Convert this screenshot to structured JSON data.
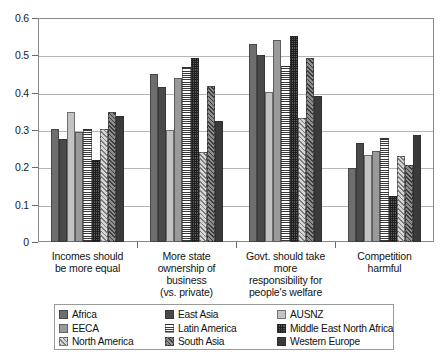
{
  "chart_data": {
    "type": "bar",
    "title": "",
    "subtitle": "",
    "xlabel": "",
    "ylabel": "",
    "ylim": [
      0,
      0.6
    ],
    "ytick_values": [
      0,
      0.1,
      0.2,
      0.3,
      0.4,
      0.5,
      0.6
    ],
    "ytick_labels": [
      "0",
      "0.1",
      "0.2",
      "0.3",
      "0.4",
      "0.5",
      "0.6"
    ],
    "grid": "horizontal",
    "legend_position": "bottom",
    "categories": [
      "Incomes should\nbe more equal",
      "More state\nownership of\nbusiness\n(vs. private)",
      "Govt. should take\nmore\nresponsibility for\npeople's welfare",
      "Competition\nharmful"
    ],
    "category_lines": [
      [
        "Incomes should",
        "be more equal"
      ],
      [
        "More state",
        "ownership of",
        "business",
        "(vs. private)"
      ],
      [
        "Govt. should take",
        "more",
        "responsibility for",
        "people's welfare"
      ],
      [
        "Competition",
        "harmful"
      ]
    ],
    "series": [
      {
        "name": "Africa",
        "pattern": "solid-medium-grey",
        "color": "#6e6e6e",
        "values": [
          0.302,
          0.451,
          0.531,
          0.198
        ]
      },
      {
        "name": "East Asia",
        "pattern": "solid-dark-grey",
        "color": "#4a4a4a",
        "values": [
          0.276,
          0.415,
          0.501,
          0.266
        ]
      },
      {
        "name": "AUSNZ",
        "pattern": "solid-light-grey",
        "color": "#c3c3c3",
        "values": [
          0.348,
          0.3,
          0.401,
          0.233
        ]
      },
      {
        "name": "EECA",
        "pattern": "solid-mid-grey",
        "color": "#9a9a9a",
        "values": [
          0.296,
          0.44,
          0.54,
          0.243
        ]
      },
      {
        "name": "Latin America",
        "pattern": "horizontal-lines",
        "color": "#3a3a3a",
        "values": [
          0.303,
          0.47,
          0.472,
          0.278
        ]
      },
      {
        "name": "Middle East North Africa",
        "pattern": "cross-grid",
        "color": "#202020",
        "values": [
          0.22,
          0.492,
          0.551,
          0.124
        ]
      },
      {
        "name": "North America",
        "pattern": "light-diagonal",
        "color": "#d6d6d6",
        "values": [
          0.303,
          0.241,
          0.333,
          0.231
        ]
      },
      {
        "name": "South Asia",
        "pattern": "dark-diagonal",
        "color": "#8d8d8d",
        "values": [
          0.349,
          0.419,
          0.492,
          0.206
        ]
      },
      {
        "name": "Western Europe",
        "pattern": "solid-very-dark",
        "color": "#3a3a3a",
        "values": [
          0.337,
          0.324,
          0.392,
          0.286
        ]
      }
    ]
  },
  "legend": {
    "items": [
      {
        "label": "Africa"
      },
      {
        "label": "East Asia"
      },
      {
        "label": "AUSNZ"
      },
      {
        "label": "EECA"
      },
      {
        "label": "Latin America"
      },
      {
        "label": "Middle East North Africa"
      },
      {
        "label": "North America"
      },
      {
        "label": "South Asia"
      },
      {
        "label": "Western Europe"
      }
    ],
    "display_order": [
      0,
      1,
      2,
      3,
      4,
      5,
      6,
      7,
      8
    ]
  }
}
